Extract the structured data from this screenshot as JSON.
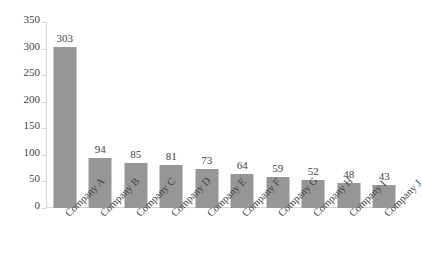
{
  "chart_data": {
    "type": "bar",
    "title": "",
    "subtitle": "",
    "xlabel": "",
    "ylabel": "",
    "categories": [
      "Company A",
      "Company B",
      "Company C",
      "Company D",
      "Company E",
      "Company F",
      "Company G",
      "Company H",
      "Company I",
      "Company J"
    ],
    "values": [
      303,
      94,
      85,
      81,
      73,
      64,
      59,
      52,
      48,
      43
    ],
    "data_labels": [
      "303",
      "94",
      "85",
      "81",
      "73",
      "64",
      "59",
      "52",
      "48",
      "43"
    ],
    "ylim": [
      0,
      350
    ],
    "ytick_step": 50,
    "ytick_labels": [
      "350",
      "300",
      "250",
      "200",
      "150",
      "100",
      "50",
      "0"
    ],
    "ytick_values": [
      350,
      300,
      250,
      200,
      150,
      100,
      50,
      0
    ],
    "grid": false,
    "legend": null,
    "legend_position": "none",
    "xtick_rotation_deg": -45,
    "series": [
      {
        "name": "",
        "values": [
          303,
          94,
          85,
          81,
          73,
          64,
          59,
          52,
          48,
          43
        ],
        "color": "#969696"
      }
    ],
    "colors": {
      "bar_fill": "#969696",
      "axis_line": "#d4d4d4",
      "text": "#3f3f3f",
      "background": "#ffffff"
    }
  }
}
